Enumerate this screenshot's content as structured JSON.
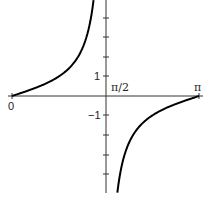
{
  "chart_data": {
    "type": "line",
    "title": "",
    "function": "tan(x)",
    "xlabel": "",
    "ylabel": "",
    "xlim": [
      0,
      3.14159
    ],
    "ylim": [
      -5,
      5
    ],
    "x_tick_labels": [
      "0",
      "π/2",
      "π"
    ],
    "y_tick_labels": [
      "1",
      "−1"
    ],
    "y_ticks": [
      -4,
      -3,
      -2,
      -1,
      1,
      2,
      3,
      4
    ],
    "grid": false,
    "asymptote": "π/2",
    "series": [
      {
        "name": "tan x (0 < x < π/2)",
        "x": [
          0,
          0.3,
          0.6,
          0.785,
          1.0,
          1.2,
          1.3,
          1.37
        ],
        "y": [
          0,
          0.31,
          0.68,
          1.0,
          1.56,
          2.57,
          3.6,
          4.9
        ]
      },
      {
        "name": "tan x (π/2 < x < π)",
        "x": [
          1.77,
          1.84,
          1.94,
          2.14,
          2.356,
          2.54,
          2.84,
          3.14159
        ],
        "y": [
          -4.9,
          -3.6,
          -2.57,
          -1.56,
          -1.0,
          -0.68,
          -0.31,
          0
        ]
      }
    ],
    "colors": {
      "curve": "#000000",
      "axis": "#333333"
    }
  },
  "labels": {
    "x0": "0",
    "xhalfpi": "π/2",
    "xpi": "π",
    "y1": "1",
    "yneg1": "−1"
  }
}
